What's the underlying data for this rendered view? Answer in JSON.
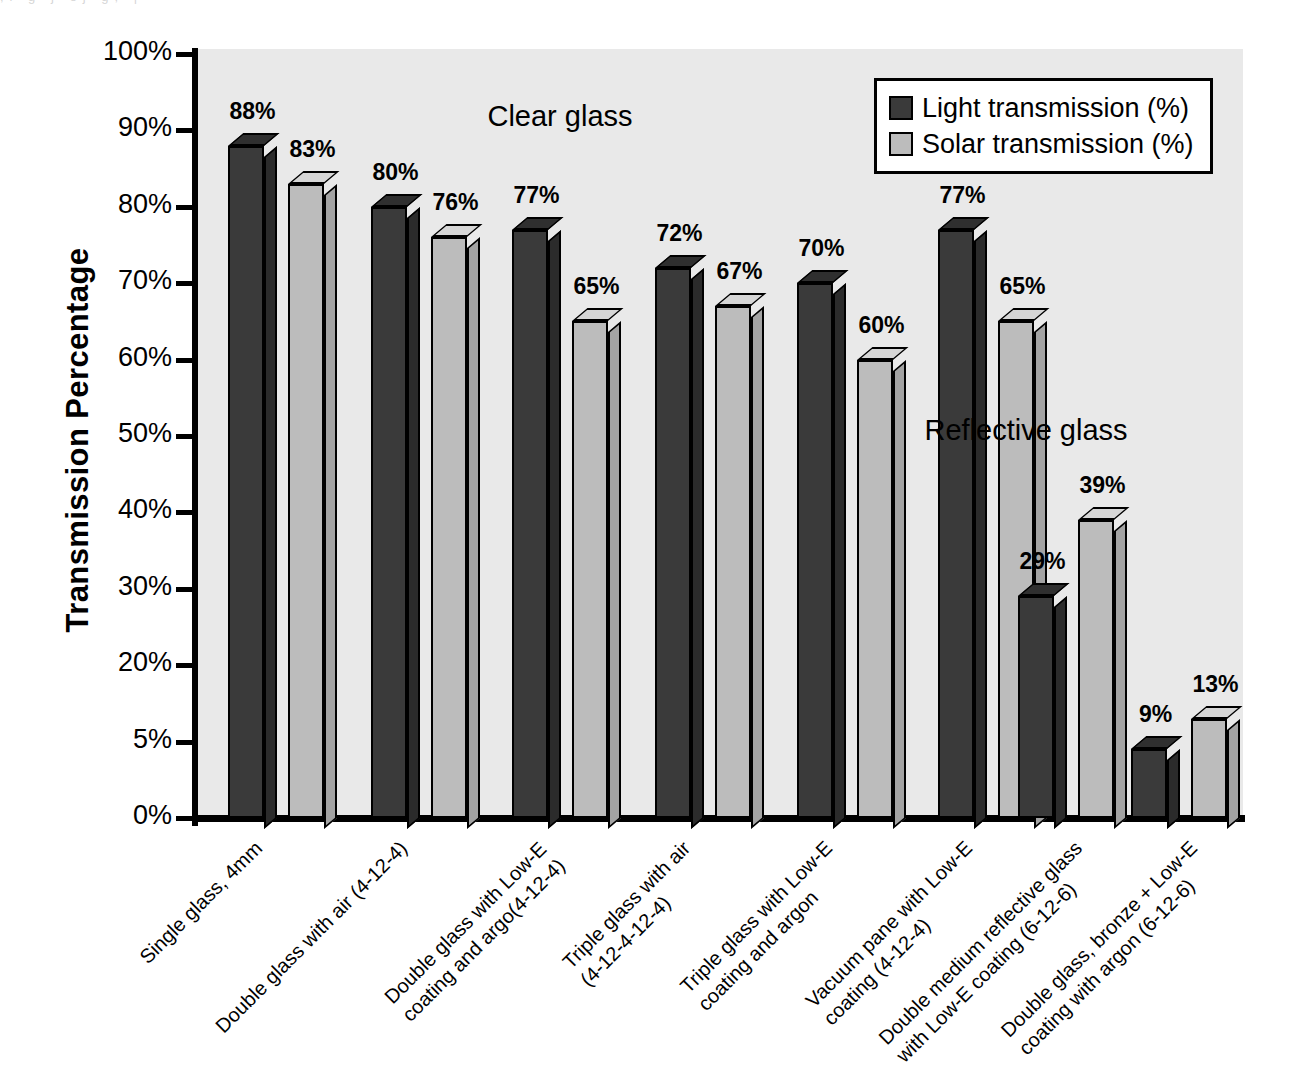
{
  "chart_data": {
    "type": "bar",
    "title": "",
    "xlabel": "",
    "ylabel": "Transmission Percentage",
    "ylim": [
      0,
      100
    ],
    "grid": false,
    "legend_position": "top-right",
    "categories": [
      "Single glass, 4mm",
      "Double glass with air (4-12-4)",
      "Double glass with Low-E coating and argo(4-12-4)",
      "Triple glass with air (4-12-4-12-4)",
      "Triple glass with Low-E coating and argon",
      "Vacuum pane with Low-E coating (4-12-4)",
      "Double medium reflective glass with Low-E coating (6-12-6)",
      "Double glass, bronze + Low-E coating with argon (6-12-6)"
    ],
    "category_lines": [
      [
        "Single glass, 4mm"
      ],
      [
        "Double glass with air (4-12-4)"
      ],
      [
        "Double glass with Low-E",
        "coating and argo(4-12-4)"
      ],
      [
        "Triple glass with air",
        "(4-12-4-12-4)"
      ],
      [
        "Triple glass with Low-E",
        "coating and argon"
      ],
      [
        "Vacuum pane with Low-E",
        "coating (4-12-4)"
      ],
      [
        "Double medium reflective glass",
        "with Low-E coating (6-12-6)"
      ],
      [
        "Double glass, bronze + Low-E",
        "coating with argon (6-12-6)"
      ]
    ],
    "series": [
      {
        "name": "Light transmission (%)",
        "color": "#3a3a3a",
        "values": [
          88,
          80,
          77,
          72,
          70,
          77,
          29,
          9
        ],
        "labels": [
          "88%",
          "80%",
          "77%",
          "72%",
          "70%",
          "77%",
          "29%",
          "9%"
        ]
      },
      {
        "name": "Solar transmission (%)",
        "color": "#bcbcbc",
        "values": [
          83,
          76,
          65,
          67,
          60,
          65,
          39,
          13
        ],
        "labels": [
          "83%",
          "76%",
          "65%",
          "67%",
          "60%",
          "65%",
          "39%",
          "13%"
        ]
      }
    ],
    "y_ticks": [
      "100%",
      "90%",
      "80%",
      "70%",
      "60%",
      "50%",
      "40%",
      "30%",
      "20%",
      "5%",
      "0%"
    ],
    "annotations": [
      {
        "text": "Clear glass",
        "x": 560,
        "y": 100
      },
      {
        "text": "Reflective glass",
        "x": 1026,
        "y": 414
      }
    ]
  },
  "legend": {
    "items": [
      {
        "label": "Light transmission (%)",
        "color": "#3a3a3a"
      },
      {
        "label": "Solar transmission (%)",
        "color": "#bcbcbc"
      }
    ]
  },
  "axis": {
    "y_title": "Transmission Percentage"
  }
}
